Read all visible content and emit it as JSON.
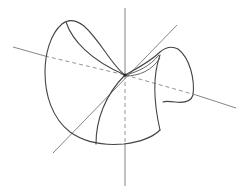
{
  "figure": {
    "title": "",
    "colors": {
      "background": "#ffffff",
      "surface_stroke": "#444444",
      "axis_stroke": "#777777"
    },
    "origin": [
      125,
      75
    ],
    "axes": [
      {
        "name": "vertical-axis",
        "from": [
          125,
          8
        ],
        "to": [
          125,
          186
        ],
        "hidden_segment_dashed": true
      },
      {
        "name": "horizontal-axis",
        "from": [
          13,
          47
        ],
        "to": [
          236,
          108
        ],
        "hidden_segment_dashed": true
      },
      {
        "name": "diagonal-axis",
        "from": [
          53,
          153
        ],
        "to": [
          177,
          25
        ],
        "hidden_segment_dashed": false
      }
    ]
  }
}
